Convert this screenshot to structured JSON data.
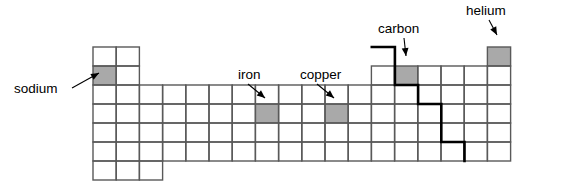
{
  "diagram": {
    "grid": {
      "origin_x": 93,
      "origin_y": 47,
      "cell_w": 23.2,
      "cell_h": 19,
      "columns": 18,
      "rows": 7,
      "line_color": "#595959",
      "line_width": 1.4,
      "cell_fill": "#ffffff",
      "row_spans": [
        {
          "row": 1,
          "segments": [
            [
              1,
              2
            ],
            [
              18,
              18
            ]
          ]
        },
        {
          "row": 2,
          "segments": [
            [
              1,
              2
            ],
            [
              13,
              18
            ]
          ]
        },
        {
          "row": 3,
          "segments": [
            [
              1,
              18
            ]
          ]
        },
        {
          "row": 4,
          "segments": [
            [
              1,
              18
            ]
          ]
        },
        {
          "row": 5,
          "segments": [
            [
              1,
              18
            ]
          ]
        },
        {
          "row": 6,
          "segments": [
            [
              1,
              18
            ]
          ]
        },
        {
          "row": 7,
          "segments": [
            [
              1,
              3
            ]
          ]
        }
      ]
    },
    "shaded_fill": "#a9a9a9",
    "shaded_cells": [
      {
        "name": "sodium",
        "col": 1,
        "row": 2
      },
      {
        "name": "iron",
        "col": 8,
        "row": 4
      },
      {
        "name": "copper",
        "col": 11,
        "row": 4
      },
      {
        "name": "carbon",
        "col": 14,
        "row": 2
      },
      {
        "name": "helium",
        "col": 18,
        "row": 1
      }
    ],
    "staircase": {
      "color": "#000000",
      "width": 2.6,
      "points": [
        [
          371.8,
          47.0
        ],
        [
          394.9,
          47.0
        ],
        [
          394.9,
          85.0
        ],
        [
          418.1,
          85.0
        ],
        [
          418.1,
          104.0
        ],
        [
          441.3,
          104.0
        ],
        [
          441.3,
          142.0
        ],
        [
          464.5,
          142.0
        ],
        [
          464.5,
          161.0
        ]
      ]
    },
    "labels": [
      {
        "id": "sodium",
        "text": "sodium",
        "x": 14,
        "y": 93,
        "anchor": "start",
        "leader": [
          [
            72,
            88
          ],
          [
            99,
            73
          ]
        ],
        "arrow_at": [
          99,
          73
        ],
        "arrow_dir": "right"
      },
      {
        "id": "iron",
        "text": "iron",
        "x": 238,
        "y": 79,
        "anchor": "start",
        "leader": [
          [
            248,
            84
          ],
          [
            265,
            98
          ]
        ],
        "arrow_at": [
          265,
          98
        ],
        "arrow_dir": "down-right"
      },
      {
        "id": "copper",
        "text": "copper",
        "x": 300,
        "y": 79,
        "anchor": "start",
        "leader": [
          [
            317,
            84
          ],
          [
            334,
            98
          ]
        ],
        "arrow_at": [
          334,
          98
        ],
        "arrow_dir": "down-right"
      },
      {
        "id": "carbon",
        "text": "carbon",
        "x": 378,
        "y": 33,
        "anchor": "start",
        "leader": [
          [
            404,
            38
          ],
          [
            406,
            56
          ]
        ],
        "arrow_at": [
          406,
          56
        ],
        "arrow_dir": "down"
      },
      {
        "id": "helium",
        "text": "helium",
        "x": 466,
        "y": 15,
        "anchor": "start",
        "leader": [
          [
            489,
            20
          ],
          [
            497,
            35
          ]
        ],
        "arrow_at": [
          497,
          35
        ],
        "arrow_dir": "down-left"
      }
    ]
  }
}
